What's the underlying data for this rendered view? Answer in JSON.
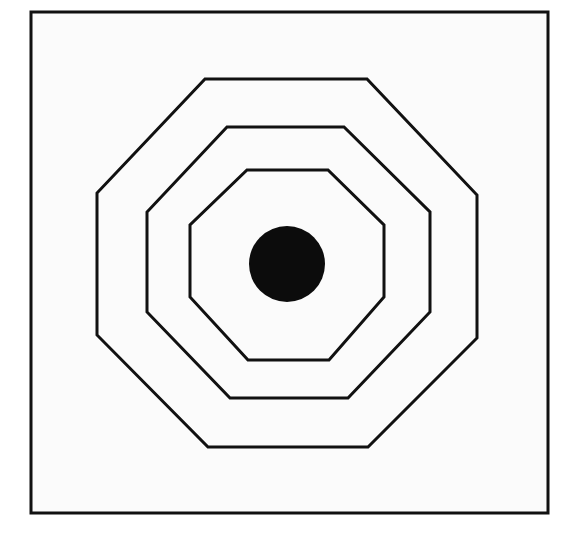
{
  "figure": {
    "canvas": {
      "width": 573,
      "height": 537
    },
    "colors": {
      "background": "#ffffff",
      "paper": "#fbfbfb",
      "ink": "#111111",
      "disc_fill": "#0c0c0c"
    },
    "elements": [
      {
        "name": "outer-frame",
        "shape": "rectangle",
        "label": "Square border"
      },
      {
        "name": "octagon-outer",
        "shape": "octagon",
        "label": "Outer octagon"
      },
      {
        "name": "octagon-middle",
        "shape": "octagon",
        "label": "Middle octagon"
      },
      {
        "name": "octagon-inner",
        "shape": "octagon",
        "label": "Inner octagon"
      },
      {
        "name": "center-disc",
        "shape": "circle",
        "label": "Center filled circle"
      }
    ]
  },
  "geometry": {
    "frame": {
      "x": 31,
      "y": 12,
      "width": 517,
      "height": 501,
      "stroke_width": 3
    },
    "center": {
      "x": 287,
      "y": 263
    },
    "octagons": [
      {
        "id": "octagon-outer",
        "stroke_width": 3,
        "points": "205,79 367,79 477,195 477,338 368,447 208,447 97,335 97,193"
      },
      {
        "id": "octagon-middle",
        "stroke_width": 3,
        "points": "227,127 344,127 430,212 430,312 348,398 230,398 147,312 147,212"
      },
      {
        "id": "octagon-inner",
        "stroke_width": 3,
        "points": "247,170 328,170 384,225 384,297 329,360 248,360 190,297 190,225"
      }
    ],
    "circle": {
      "id": "center-disc",
      "cx": 287,
      "cy": 264,
      "r": 38
    }
  }
}
